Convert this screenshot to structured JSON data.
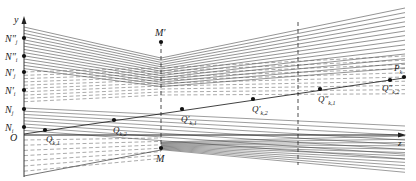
{
  "diagram": {
    "axes": {
      "y_label": "y",
      "z_label": "z",
      "origin_label": "O"
    },
    "y_axis_marks": [
      {
        "id": "N_i",
        "base": "N",
        "prime": "",
        "sub": "i"
      },
      {
        "id": "N_j",
        "base": "N",
        "prime": "",
        "sub": "j"
      },
      {
        "id": "N'_i",
        "base": "N",
        "prime": "′",
        "sub": "i"
      },
      {
        "id": "N'_j",
        "base": "N",
        "prime": "′",
        "sub": "j"
      },
      {
        "id": "N''_i",
        "base": "N",
        "prime": "″",
        "sub": "i"
      },
      {
        "id": "N''_j",
        "base": "N",
        "prime": "″",
        "sub": "j"
      }
    ],
    "section_marks": [
      {
        "id": "M_prime",
        "label": "M′"
      },
      {
        "id": "M",
        "label": "M"
      }
    ],
    "path_points": [
      {
        "id": "Q_k1",
        "base": "Q",
        "prime": "",
        "sub": "k,1"
      },
      {
        "id": "Q_k2",
        "base": "Q",
        "prime": "",
        "sub": "k,2"
      },
      {
        "id": "Q'_k1",
        "base": "Q",
        "prime": "′",
        "sub": "k,1"
      },
      {
        "id": "Q'_k2",
        "base": "Q",
        "prime": "′",
        "sub": "k,2"
      },
      {
        "id": "Q''_k1",
        "base": "Q",
        "prime": "″",
        "sub": "k,1"
      },
      {
        "id": "Q''_k2",
        "base": "Q",
        "prime": "″",
        "sub": "k,2"
      },
      {
        "id": "P_k",
        "base": "P",
        "prime": "",
        "sub": "k"
      }
    ],
    "line_color": "#3a3a3a",
    "dash_color": "#555555"
  }
}
